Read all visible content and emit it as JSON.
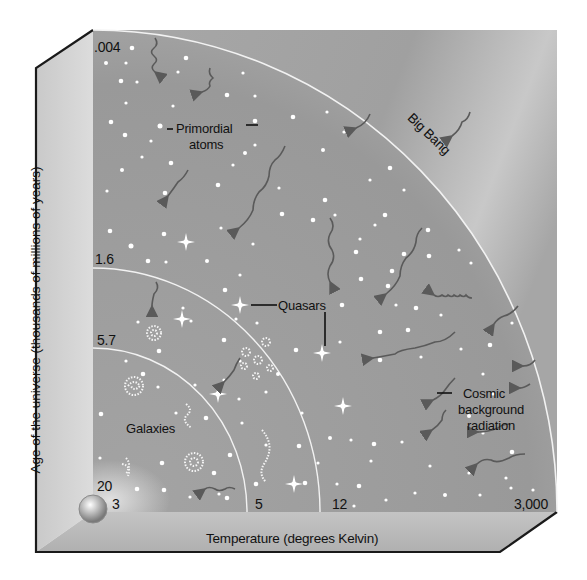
{
  "diagram": {
    "y_axis_label": "Age of the universe (thousands of millions of years)",
    "x_axis_label": "Temperature (degrees Kelvin)",
    "y_ticks": [
      ".004",
      "1.6",
      "5.7",
      "20"
    ],
    "x_ticks": [
      "3",
      "5",
      "12",
      "3,000"
    ],
    "boundary_label": "Big Bang",
    "labels": {
      "primordial_line1": "Primordial",
      "primordial_line2": "atoms",
      "quasars": "Quasars",
      "galaxies": "Galaxies",
      "cosmic_line1": "Cosmic",
      "cosmic_line2": "background",
      "cosmic_line3": "radiation"
    },
    "eras": [
      {
        "age": ".004",
        "temperature": "3,000",
        "content": "Primordial atoms"
      },
      {
        "age": "1.6",
        "temperature": "12",
        "content": "Quasars"
      },
      {
        "age": "5.7",
        "temperature": "5",
        "content": "Galaxies"
      },
      {
        "age": "20",
        "temperature": "3",
        "content": "Earth (present)"
      }
    ],
    "colors": {
      "panel": "#9a9a9a",
      "panel_light": "#c8c8c8",
      "side_wall": "#d2d2d2",
      "floor": "#bdbdbd",
      "arc": "#f2f2f2",
      "star": "#ffffff",
      "wave": "#5a5a5a",
      "border": "#1a1a1a",
      "text": "#111111"
    }
  }
}
